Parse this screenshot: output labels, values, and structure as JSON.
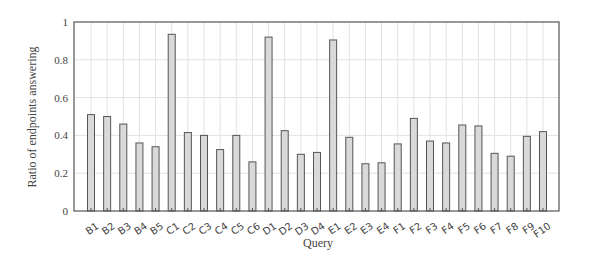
{
  "chart_data": {
    "type": "bar",
    "title": "",
    "xlabel": "Query",
    "ylabel": "Ratio of endpoints answering",
    "ylim": [
      0,
      1
    ],
    "yticks": [
      0,
      0.2,
      0.4,
      0.6,
      0.8,
      1
    ],
    "ytick_labels": [
      "0",
      "0.2",
      "0.4",
      "0.6",
      "0.8",
      "1"
    ],
    "grid": true,
    "legend": null,
    "categories": [
      "B1",
      "B2",
      "B3",
      "B4",
      "B5",
      "C1",
      "C2",
      "C3",
      "C4",
      "C5",
      "C6",
      "D1",
      "D2",
      "D3",
      "D4",
      "E1",
      "E2",
      "E3",
      "E4",
      "F1",
      "F2",
      "F3",
      "F4",
      "F5",
      "F6",
      "F7",
      "F8",
      "F9",
      "F10"
    ],
    "values": [
      0.51,
      0.5,
      0.46,
      0.36,
      0.34,
      0.935,
      0.415,
      0.4,
      0.325,
      0.4,
      0.26,
      0.92,
      0.425,
      0.3,
      0.31,
      0.905,
      0.39,
      0.25,
      0.255,
      0.355,
      0.49,
      0.37,
      0.36,
      0.455,
      0.45,
      0.305,
      0.29,
      0.395,
      0.42
    ],
    "colors": {
      "bar_fill": "#d9d9d9",
      "bar_stroke": "#555555",
      "grid": "#e2e2e2",
      "frame": "#555555"
    }
  },
  "labels": {
    "xlabel": "Query",
    "ylabel": "Ratio of endpoints answering"
  }
}
